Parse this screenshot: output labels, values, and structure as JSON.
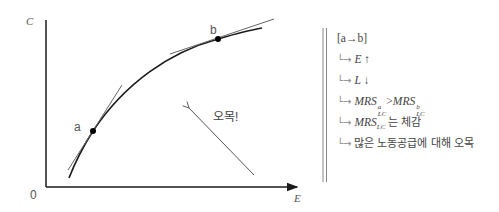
{
  "graph": {
    "y_axis_label": "C",
    "x_axis_label": "E",
    "origin_label": "0",
    "point_a_label": "a",
    "point_b_label": "b",
    "arrow_label": "오목!",
    "colors": {
      "axis": "#1a1a1a",
      "curve": "#1a1a1a",
      "tangent": "#666666",
      "arrow": "#555555"
    }
  },
  "notes": {
    "header": "[a→b]",
    "bullet_glyph": "└→",
    "rows": [
      {
        "var": "E",
        "arrow": "↑"
      },
      {
        "var": "L",
        "arrow": "↓"
      },
      {
        "lhs": "MRS",
        "lhs_sup": "a",
        "lhs_sub": "LC",
        "op": ">",
        "rhs": "MRS",
        "rhs_sup": "b",
        "rhs_sub": "LC"
      },
      {
        "var": "MRS",
        "sub": "LC",
        "text": "는 체감"
      },
      {
        "text": "많은 노동공급에 대해 오목"
      }
    ]
  }
}
